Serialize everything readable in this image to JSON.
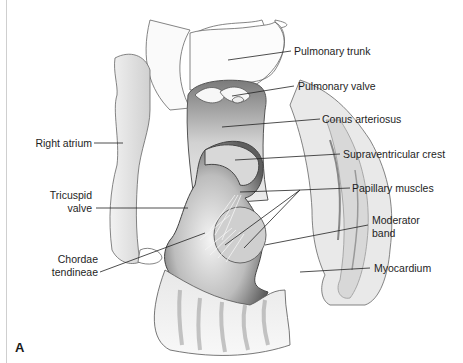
{
  "figure": {
    "panel_letter": "A",
    "labels": {
      "pulmonary_trunk": "Pulmonary trunk",
      "pulmonary_valve": "Pulmonary valve",
      "conus_arteriosus": "Conus arteriosus",
      "right_atrium": "Right atrium",
      "supraventricular_crest": "Supraventricular crest",
      "tricuspid_valve_line1": "Tricuspid",
      "tricuspid_valve_line2": "valve",
      "papillary_muscles": "Papillary muscles",
      "moderator_band_line1": "Moderator",
      "moderator_band_line2": "band",
      "chordae_tendineae_line1": "Chordae",
      "chordae_tendineae_line2": "tendineae",
      "myocardium": "Myocardium"
    },
    "colors": {
      "outline": "#555555",
      "shade_dark": "#6e6e6e",
      "shade_mid": "#b5b5b5",
      "shade_light": "#e6e6e6",
      "leader": "#222222"
    }
  }
}
